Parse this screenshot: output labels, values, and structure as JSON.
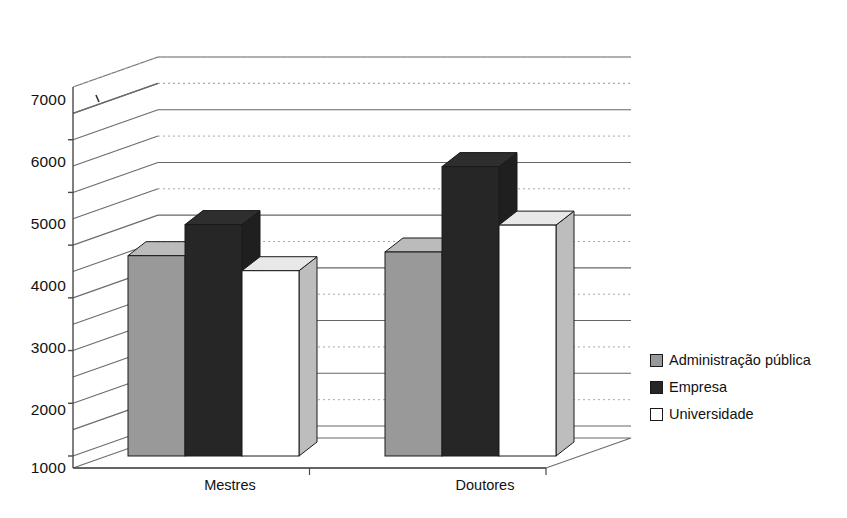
{
  "chart_data": {
    "type": "bar",
    "title": "",
    "subtitle": "",
    "xlabel": "",
    "ylabel": "",
    "categories": [
      "Mestres",
      "Doutores"
    ],
    "series": [
      {
        "name": "Administração pública",
        "color": "#999999",
        "values": [
          4800,
          4870
        ]
      },
      {
        "name": "Empresa",
        "color": "#262626",
        "values": [
          5390,
          6490
        ]
      },
      {
        "name": "Universidade",
        "color": "#ffffff",
        "values": [
          4515,
          5380
        ]
      }
    ],
    "ylim": [
      1000,
      8000
    ],
    "yticks": [
      1000,
      2000,
      3000,
      4000,
      5000,
      6000,
      7000
    ],
    "ytick_labels": [
      "1000",
      "2000",
      "3000",
      "4000",
      "5000",
      "6000",
      "7000"
    ],
    "minor_ticks": [
      1500,
      2500,
      3500,
      4500,
      5500,
      6500,
      7500
    ],
    "grid": "horizontal-major-solid-minor-dotted",
    "legend_position": "right",
    "style": "3d-bar",
    "annotations": []
  },
  "axis": {
    "y_ticks": [
      {
        "label": "7000",
        "top": 91
      },
      {
        "label": "6000",
        "top": 153
      },
      {
        "label": "5000",
        "top": 215
      },
      {
        "label": "4000",
        "top": 277
      },
      {
        "label": "3000",
        "top": 339
      },
      {
        "label": "2000",
        "top": 401
      },
      {
        "label": "1000",
        "top": 459
      }
    ],
    "x_categories": [
      {
        "label": "Mestres",
        "left": 135,
        "width": 190
      },
      {
        "label": "Doutores",
        "left": 390,
        "width": 190
      }
    ]
  },
  "legend": {
    "items": [
      {
        "label": "Administração pública",
        "swatch": "#999999",
        "swatch_name": "swatch-administracao-publica"
      },
      {
        "label": "Empresa",
        "swatch": "#262626",
        "swatch_name": "swatch-empresa"
      },
      {
        "label": "Universidade",
        "swatch": "#ffffff",
        "swatch_name": "swatch-universidade"
      }
    ]
  },
  "bars": [
    {
      "name": "bar-mestres-administracao-publica",
      "group": "Mestres",
      "series": "Administração pública",
      "value": 4800
    },
    {
      "name": "bar-mestres-empresa",
      "group": "Mestres",
      "series": "Empresa",
      "value": 5390
    },
    {
      "name": "bar-mestres-universidade",
      "group": "Mestres",
      "series": "Universidade",
      "value": 4515
    },
    {
      "name": "bar-doutores-administracao-publica",
      "group": "Doutores",
      "series": "Administração pública",
      "value": 4870
    },
    {
      "name": "bar-doutores-empresa",
      "group": "Doutores",
      "series": "Empresa",
      "value": 6490
    },
    {
      "name": "bar-doutores-universidade",
      "group": "Doutores",
      "series": "Universidade",
      "value": 5380
    }
  ]
}
